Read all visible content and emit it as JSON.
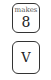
{
  "keys": [
    {
      "caption": "makes",
      "label": "8"
    },
    {
      "label": "V"
    }
  ]
}
